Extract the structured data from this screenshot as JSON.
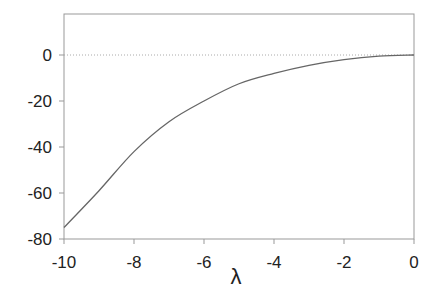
{
  "chart_data": {
    "type": "line",
    "title": "",
    "xlabel": "λ",
    "ylabel": "",
    "xlim": [
      -10,
      0
    ],
    "ylim": [
      -80,
      18
    ],
    "xticks": [
      -10,
      -8,
      -6,
      -4,
      -2,
      0
    ],
    "yticks": [
      0,
      -20,
      -40,
      -60,
      -80
    ],
    "grid": false,
    "reference_line": {
      "y": 0,
      "style": "dotted"
    },
    "series": [
      {
        "name": "curve",
        "x": [
          -10,
          -9,
          -8,
          -7,
          -6,
          -5,
          -4,
          -3,
          -2,
          -1,
          0
        ],
        "values": [
          -75,
          -59,
          -42,
          -29,
          -20,
          -12.5,
          -8,
          -4.5,
          -2,
          -0.5,
          0
        ]
      }
    ]
  },
  "colors": {
    "axis": "#888888",
    "line": "#666666",
    "text": "#222222"
  }
}
